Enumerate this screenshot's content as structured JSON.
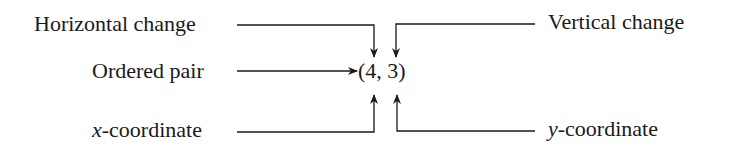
{
  "diagram": {
    "center": {
      "text": "(4, 3)"
    },
    "labels": {
      "horizontal_change": "Horizontal change",
      "vertical_change": "Vertical change",
      "ordered_pair": "Ordered pair",
      "x_coordinate_var": "x",
      "x_coordinate_rest": "-coordinate",
      "y_coordinate_var": "y",
      "y_coordinate_rest": "-coordinate"
    },
    "arrows": [
      {
        "from": "Horizontal change",
        "to": "4",
        "direction": "down"
      },
      {
        "from": "Vertical change",
        "to": "3",
        "direction": "down"
      },
      {
        "from": "Ordered pair",
        "to": "(4, 3)",
        "direction": "right"
      },
      {
        "from": "x-coordinate",
        "to": "4",
        "direction": "up"
      },
      {
        "from": "y-coordinate",
        "to": "3",
        "direction": "up"
      }
    ],
    "colors": {
      "ink": "#1a1a1a",
      "background": "#ffffff"
    }
  }
}
